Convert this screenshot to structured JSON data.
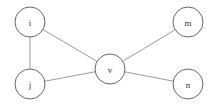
{
  "diagram": {
    "type": "undirected-graph",
    "canvas": {
      "width": 215,
      "height": 106,
      "background": "#ffffff"
    },
    "style": {
      "node_fill": "#ffffff",
      "node_stroke": "#555555",
      "node_radius": 15,
      "edge_stroke": "#808080",
      "label_color": "#333333"
    },
    "nodes": [
      {
        "id": "i",
        "label": "i",
        "cx": 30,
        "cy": 22,
        "r": 15
      },
      {
        "id": "j",
        "label": "j",
        "cx": 30,
        "cy": 84,
        "r": 15
      },
      {
        "id": "v",
        "label": "v",
        "cx": 110,
        "cy": 69,
        "r": 15
      },
      {
        "id": "m",
        "label": "m",
        "cx": 188,
        "cy": 22,
        "r": 15
      },
      {
        "id": "n",
        "label": "n",
        "cx": 188,
        "cy": 84,
        "r": 15
      }
    ],
    "edges": [
      {
        "id": "edge-i-j",
        "source": "i",
        "target": "j"
      },
      {
        "id": "edge-i-v",
        "source": "i",
        "target": "v"
      },
      {
        "id": "edge-j-v",
        "source": "j",
        "target": "v"
      },
      {
        "id": "edge-v-m",
        "source": "v",
        "target": "m"
      },
      {
        "id": "edge-v-n",
        "source": "v",
        "target": "n"
      }
    ]
  }
}
